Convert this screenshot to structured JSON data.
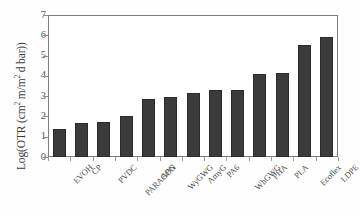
{
  "chart_data": {
    "type": "bar",
    "title": "",
    "xlabel": "",
    "ylabel": "Log(OTR (cm2 m/m2 d bar))",
    "ylabel_parts": {
      "prefix": "Log(OTR (cm",
      "sup1": "2",
      "mid": " m/m",
      "sup2": "2",
      "suffix": " d bar))"
    },
    "categories": [
      "EVOH",
      "CP",
      "PVDC",
      "PARAGON",
      "APG",
      "WyGWG",
      "AmyG",
      "PA6",
      "WhGWG",
      "PHA",
      "PLA",
      "Ecoflex",
      "LDPE"
    ],
    "values": [
      1.4,
      1.7,
      1.75,
      2.0,
      2.85,
      2.95,
      3.15,
      3.3,
      3.3,
      4.1,
      4.15,
      5.5,
      5.9
    ],
    "ylim": [
      0,
      7
    ],
    "ytick_labels": [
      "0",
      "1",
      "2",
      "3",
      "4",
      "5",
      "6",
      "7"
    ],
    "ytick_values": [
      0,
      1,
      2,
      3,
      4,
      5,
      6,
      7
    ],
    "grid": false,
    "legend": false,
    "legend_position": "none",
    "bar_color": "#3b3b3b",
    "bar_edge_color": "#2a2a2a",
    "axis_color": "#7d7d7d",
    "background_color": "#ffffff",
    "series_name": "OTR"
  }
}
